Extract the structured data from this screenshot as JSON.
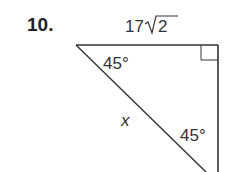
{
  "problem": {
    "number": "10."
  },
  "diagram": {
    "type": "right-isosceles-triangle",
    "top_side_label": "17√2",
    "top_side_coefficient": "17",
    "top_side_radicand": "2",
    "hypotenuse_label": "x",
    "angle_top_left": "45°",
    "angle_bottom": "45°",
    "right_angle_marker": true,
    "stroke_color": "#333333"
  }
}
